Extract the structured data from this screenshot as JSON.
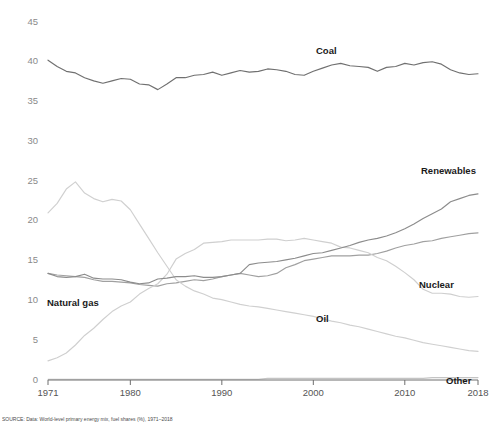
{
  "chart_data": {
    "type": "line",
    "title": "",
    "xlabel": "",
    "ylabel": "",
    "xlim": [
      1971,
      2018
    ],
    "ylim": [
      0,
      45
    ],
    "grid": false,
    "legend_position": "inline-labels",
    "x_ticks": [
      "1971",
      "1980",
      "1990",
      "2000",
      "2010",
      "2018"
    ],
    "x_tick_values": [
      1971,
      1980,
      1990,
      2000,
      2010,
      2018
    ],
    "y_ticks": [
      "0",
      "5",
      "10",
      "15",
      "20",
      "25",
      "30",
      "35",
      "40",
      "45"
    ],
    "y_tick_values": [
      0,
      5,
      10,
      15,
      20,
      25,
      30,
      35,
      40,
      45
    ],
    "x": [
      1971,
      1972,
      1973,
      1974,
      1975,
      1976,
      1977,
      1978,
      1979,
      1980,
      1981,
      1982,
      1983,
      1984,
      1985,
      1986,
      1987,
      1988,
      1989,
      1990,
      1991,
      1992,
      1993,
      1994,
      1995,
      1996,
      1997,
      1998,
      1999,
      2000,
      2001,
      2002,
      2003,
      2004,
      2005,
      2006,
      2007,
      2008,
      2009,
      2010,
      2011,
      2012,
      2013,
      2014,
      2015,
      2016,
      2017,
      2018
    ],
    "series": [
      {
        "name": "Coal",
        "color": "#707070",
        "values": [
          40.2,
          39.4,
          38.8,
          38.6,
          38.0,
          37.6,
          37.3,
          37.6,
          37.9,
          37.8,
          37.2,
          37.1,
          36.5,
          37.2,
          38.0,
          38.0,
          38.3,
          38.4,
          38.7,
          38.3,
          38.6,
          38.9,
          38.7,
          38.8,
          39.1,
          39.0,
          38.8,
          38.4,
          38.3,
          38.8,
          39.2,
          39.6,
          39.8,
          39.5,
          39.4,
          39.3,
          38.8,
          39.3,
          39.4,
          39.8,
          39.6,
          39.9,
          40.0,
          39.7,
          39.0,
          38.6,
          38.4,
          38.5
        ]
      },
      {
        "name": "Natural gas",
        "color": "#a0a0a0",
        "values": [
          13.4,
          13.2,
          13.1,
          13.0,
          12.9,
          12.6,
          12.4,
          12.4,
          12.3,
          12.2,
          12.0,
          11.9,
          11.8,
          12.1,
          12.2,
          12.4,
          12.6,
          12.5,
          12.7,
          13.0,
          13.2,
          13.4,
          13.2,
          13.0,
          13.1,
          13.4,
          14.1,
          14.5,
          15.0,
          15.2,
          15.4,
          15.6,
          15.6,
          15.6,
          15.7,
          15.7,
          15.9,
          16.2,
          16.6,
          16.9,
          17.1,
          17.4,
          17.5,
          17.8,
          18.0,
          18.2,
          18.4,
          18.5
        ]
      },
      {
        "name": "Oil",
        "color": "#d0d0d0",
        "values": [
          21.0,
          22.2,
          24.0,
          24.9,
          23.5,
          22.8,
          22.4,
          22.7,
          22.5,
          21.4,
          19.6,
          17.8,
          16.0,
          14.3,
          12.6,
          11.8,
          11.2,
          10.8,
          10.3,
          10.1,
          9.8,
          9.5,
          9.3,
          9.2,
          9.0,
          8.8,
          8.6,
          8.4,
          8.2,
          8.0,
          7.7,
          7.4,
          7.2,
          6.9,
          6.7,
          6.4,
          6.1,
          5.8,
          5.5,
          5.3,
          5.0,
          4.7,
          4.5,
          4.3,
          4.1,
          3.9,
          3.7,
          3.6
        ]
      },
      {
        "name": "Nuclear",
        "color": "#cfcfcf",
        "values": [
          2.4,
          2.8,
          3.4,
          4.4,
          5.6,
          6.5,
          7.6,
          8.6,
          9.3,
          9.8,
          10.8,
          11.5,
          12.1,
          13.3,
          15.2,
          15.9,
          16.4,
          17.2,
          17.3,
          17.4,
          17.6,
          17.6,
          17.6,
          17.6,
          17.7,
          17.7,
          17.5,
          17.6,
          17.8,
          17.6,
          17.4,
          17.2,
          16.7,
          16.6,
          16.3,
          16.0,
          15.4,
          15.0,
          14.3,
          13.5,
          12.6,
          11.4,
          10.9,
          10.9,
          10.8,
          10.5,
          10.4,
          10.5
        ]
      },
      {
        "name": "Renewables",
        "color": "#8c8c8c",
        "values": [
          13.4,
          13.0,
          12.9,
          13.0,
          13.3,
          12.8,
          12.7,
          12.7,
          12.6,
          12.3,
          12.1,
          12.2,
          12.7,
          12.8,
          13.0,
          13.0,
          13.1,
          12.9,
          12.9,
          13.0,
          13.2,
          13.4,
          14.5,
          14.7,
          14.8,
          14.9,
          15.1,
          15.3,
          15.6,
          15.9,
          16.0,
          16.3,
          16.6,
          16.9,
          17.3,
          17.6,
          17.8,
          18.1,
          18.5,
          19.0,
          19.6,
          20.3,
          20.9,
          21.5,
          22.4,
          22.8,
          23.2,
          23.4
        ]
      },
      {
        "name": "Other",
        "color": "#c4c4c4",
        "values": [
          0.1,
          0.1,
          0.1,
          0.1,
          0.1,
          0.1,
          0.1,
          0.1,
          0.1,
          0.1,
          0.1,
          0.1,
          0.1,
          0.1,
          0.1,
          0.1,
          0.1,
          0.1,
          0.1,
          0.1,
          0.1,
          0.1,
          0.1,
          0.1,
          0.2,
          0.2,
          0.2,
          0.2,
          0.2,
          0.2,
          0.2,
          0.2,
          0.2,
          0.2,
          0.2,
          0.2,
          0.2,
          0.2,
          0.2,
          0.2,
          0.2,
          0.2,
          0.3,
          0.3,
          0.3,
          0.3,
          0.3,
          0.3
        ]
      }
    ],
    "inline_labels": [
      {
        "name": "coal-label",
        "text": "Coal",
        "x": 316,
        "y": 54
      },
      {
        "name": "renewables-label",
        "text": "Renewables",
        "x": 421,
        "y": 174
      },
      {
        "name": "nuclear-label",
        "text": "Nuclear",
        "x": 419,
        "y": 288
      },
      {
        "name": "natural-gas-label",
        "text": "Natural gas",
        "x": 47,
        "y": 306
      },
      {
        "name": "oil-label",
        "text": "Oil",
        "x": 316,
        "y": 322
      },
      {
        "name": "other-label",
        "text": "Other",
        "x": 446,
        "y": 384
      }
    ]
  },
  "caption": {
    "text": "SOURCE: Data: World-level primary energy mix, fuel shares (%), 1971–2018"
  }
}
